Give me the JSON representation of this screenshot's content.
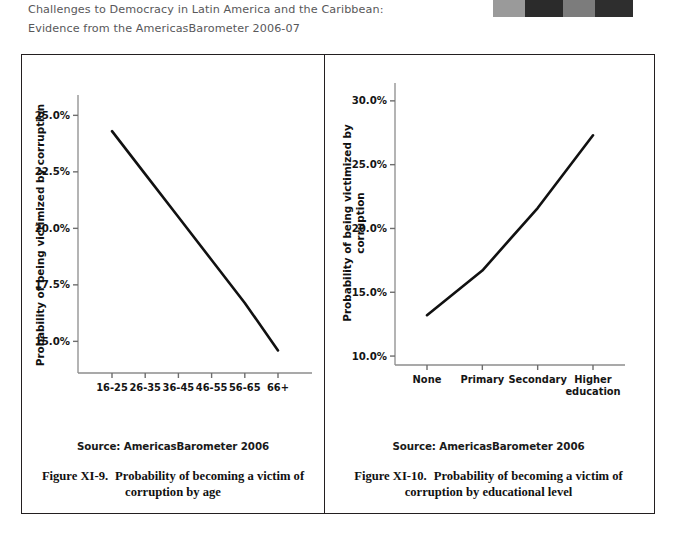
{
  "header": {
    "line1": "Challenges to Democracy in Latin America and the Caribbean:",
    "line2": "Evidence from the AmericasBarometer 2006-07",
    "color": "#58585a"
  },
  "scan_artifact": {
    "name": "scan-edge-strip",
    "blocks": [
      "#9a9a9a",
      "#2b2b2b",
      "#7c7c7c",
      "#2e2e2e",
      "#ffffff"
    ]
  },
  "figures": [
    {
      "id": "figure-xi-9",
      "source": "Source: AmericasBarometer  2006",
      "caption_number": "Figure XI-9.",
      "caption_text": "Probability of becoming a victim of",
      "caption_text2": "corruption by age",
      "chart_data": {
        "type": "line",
        "title": "",
        "xlabel": "",
        "ylabel": "Probability of being victimized by corruption",
        "categories": [
          "16-25",
          "26-35",
          "36-45",
          "46-55",
          "56-65",
          "66+"
        ],
        "values": [
          24.3,
          22.4,
          20.5,
          18.6,
          16.7,
          14.6
        ],
        "ytick_labels": [
          "25.0%",
          "22.5%",
          "20.0%",
          "17.5%",
          "15.0%"
        ],
        "yticks": [
          25.0,
          22.5,
          20.0,
          17.5,
          15.0
        ],
        "ylim": [
          13.6,
          25.9
        ],
        "grid": false,
        "legend": "none",
        "line_color": "#111111"
      }
    },
    {
      "id": "figure-xi-10",
      "source": "Source: AmericasBarometer  2006",
      "caption_number": "Figure XI-10.",
      "caption_text": "Probability of becoming a victim of",
      "caption_text2": "corruption by educational level",
      "chart_data": {
        "type": "line",
        "title": "",
        "xlabel": "",
        "ylabel": "Probability of being victimized by corruption",
        "categories": [
          "None",
          "Primary",
          "Secondary",
          "Higher education"
        ],
        "values": [
          13.2,
          16.7,
          21.6,
          27.3
        ],
        "ytick_labels": [
          "30.0%",
          "25.0%",
          "20.0%",
          "15.0%",
          "10.0%"
        ],
        "yticks": [
          30.0,
          25.0,
          20.0,
          15.0,
          10.0
        ],
        "ylim": [
          9.3,
          31.4
        ],
        "grid": false,
        "legend": "none",
        "line_color": "#111111"
      }
    }
  ]
}
